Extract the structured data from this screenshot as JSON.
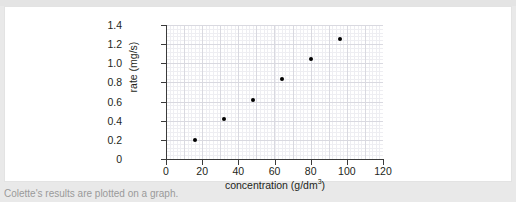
{
  "caption": "Colette's results are plotted on a graph.",
  "chart_data": {
    "type": "scatter",
    "title": "",
    "xlabel_prefix": "concentration (g/dm",
    "xlabel_sup": "3",
    "xlabel_suffix": ")",
    "xlabel": "concentration (g/dm3)",
    "ylabel": "rate (mg/s)",
    "xlim": [
      0,
      120
    ],
    "ylim": [
      0,
      1.4
    ],
    "xticks": [
      "0",
      "20",
      "40",
      "60",
      "80",
      "100",
      "120"
    ],
    "xtick_values": [
      0,
      20,
      40,
      60,
      80,
      100,
      120
    ],
    "yticks": [
      "0",
      "0.2",
      "0.4",
      "0.6",
      "0.8",
      "1.0",
      "1.2",
      "1.4"
    ],
    "ytick_values": [
      0,
      0.2,
      0.4,
      0.6,
      0.8,
      1.0,
      1.2,
      1.4
    ],
    "grid": true,
    "grid_style": "graph-paper",
    "legend": false,
    "marker_color": "#000000",
    "x": [
      16,
      32,
      48,
      64,
      80,
      96
    ],
    "y": [
      0.2,
      0.42,
      0.62,
      0.84,
      1.04,
      1.25
    ],
    "points": [
      {
        "x": 16,
        "y": 0.2
      },
      {
        "x": 32,
        "y": 0.42
      },
      {
        "x": 48,
        "y": 0.62
      },
      {
        "x": 64,
        "y": 0.84
      },
      {
        "x": 80,
        "y": 1.04
      },
      {
        "x": 96,
        "y": 1.25
      }
    ]
  }
}
